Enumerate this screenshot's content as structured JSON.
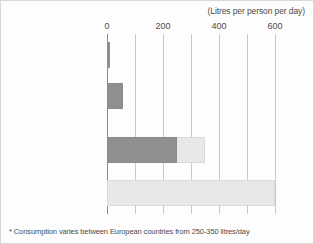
{
  "chart_data": {
    "type": "bar",
    "orientation": "horizontal",
    "title": "",
    "unit_caption": "(Litres per person per day)",
    "xlabel": "",
    "ylabel": "",
    "xlim": [
      0,
      620
    ],
    "grid": true,
    "legend": "none",
    "categories": [
      "Average\nSub-Saharan African",
      "UN recommended\nbasic minimum",
      "Average European*",
      "Average American"
    ],
    "values": [
      10,
      57,
      350,
      600
    ],
    "series": [
      {
        "name": "Typical consumption",
        "values": [
          10,
          57,
          350,
          600
        ]
      },
      {
        "name": "European lower range",
        "values": [
          null,
          null,
          250,
          null
        ]
      }
    ],
    "bar_segments": [
      {
        "category": "Average\nSub-Saharan African",
        "dark_to": 10,
        "light_to": 10
      },
      {
        "category": "UN recommended\nbasic minimum",
        "dark_to": 57,
        "light_to": 57
      },
      {
        "category": "Average European*",
        "dark_to": 250,
        "light_to": 350
      },
      {
        "category": "Average American",
        "dark_to": 0,
        "light_to": 600
      }
    ],
    "xticks": [
      0,
      200,
      400,
      600
    ],
    "xtick_labels": [
      "0",
      "200",
      "400",
      "600"
    ],
    "xminor_ticks": [
      100,
      300,
      500
    ],
    "annotations": [
      "* Consumption varies between European countries from 250-350 litres/day"
    ],
    "colors": {
      "dark_bar": "#8f8f8f",
      "light_bar": "#e8e8e8",
      "gridline": "#c9c9c9",
      "axis": "#8a8a8a",
      "text": "#3d3d3d",
      "background": "#fdfdfd",
      "border": "#d8d8d8"
    }
  },
  "footnote": "* Consumption varies between European countries from 250-350 litres/day"
}
